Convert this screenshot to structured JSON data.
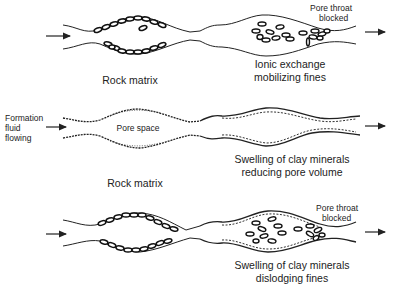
{
  "diagram": {
    "type": "formation damage mechanisms schematic",
    "panels": [
      {
        "id": "top-left",
        "caption": "Rock matrix",
        "content": "pore channel lined with clay fines attached to walls"
      },
      {
        "id": "top-right",
        "caption_line1": "Ionic exchange",
        "caption_line2": "mobilizing fines",
        "annotation_line1": "Pore throat",
        "annotation_line2": "blocked",
        "content": "detached fines migrating and plugging pore throat"
      },
      {
        "id": "middle-left",
        "caption": "Rock matrix",
        "inner_label": "Pore space",
        "flow_label_line1": "Formation",
        "flow_label_line2": "fluid",
        "flow_label_line3": "flowing",
        "content": "clean pore channel with thin clay coating"
      },
      {
        "id": "middle-right",
        "caption_line1": "Swelling of clay minerals",
        "caption_line2": "reducing pore volume",
        "content": "swollen clay coating narrowing the pore"
      },
      {
        "id": "bottom-left",
        "caption": "",
        "content": "pore channel lined with clay fines"
      },
      {
        "id": "bottom-right",
        "caption_line1": "Swelling of clay minerals",
        "caption_line2": "dislodging fines",
        "annotation_line1": "Pore throat",
        "annotation_line2": "blocked",
        "content": "swollen clay dislodging fines that plug pore throat"
      }
    ],
    "icons": [
      "flow-arrow-icon"
    ]
  }
}
